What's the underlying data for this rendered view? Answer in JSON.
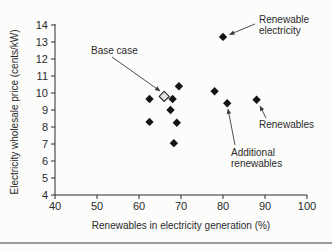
{
  "figure": {
    "background": "#fcfcfb",
    "ink_color": "#2a2a2a",
    "marker_color": "#141414",
    "arrow_color": "#3a3a3a",
    "rule_color": "#9b9b9b"
  },
  "chart_data": {
    "type": "scatter",
    "title": "",
    "xlabel": "Renewables in electricity generation (%)",
    "ylabel": "Electricity wholesale price (cents/kW)",
    "xlim": [
      40,
      100
    ],
    "ylim": [
      4,
      14
    ],
    "xticks": [
      40,
      50,
      60,
      70,
      80,
      90,
      100
    ],
    "yticks": [
      4,
      5,
      6,
      7,
      8,
      9,
      10,
      11,
      12,
      13,
      14
    ],
    "grid": false,
    "legend": "none",
    "series": [
      {
        "name": "Base case",
        "marker": "open-diamond",
        "points": [
          {
            "x": 66,
            "y": 9.8
          }
        ]
      },
      {
        "name": "Scenario results",
        "marker": "filled-diamond",
        "points": [
          {
            "x": 62.5,
            "y": 9.65
          },
          {
            "x": 62.5,
            "y": 8.3
          },
          {
            "x": 67.5,
            "y": 9.0
          },
          {
            "x": 68.0,
            "y": 9.65
          },
          {
            "x": 68.3,
            "y": 7.05
          },
          {
            "x": 69.0,
            "y": 8.25
          },
          {
            "x": 69.5,
            "y": 10.4
          },
          {
            "x": 78.0,
            "y": 10.1
          },
          {
            "x": 80.0,
            "y": 13.3
          },
          {
            "x": 81.0,
            "y": 9.4
          },
          {
            "x": 88.0,
            "y": 9.6
          }
        ]
      }
    ],
    "annotations": [
      {
        "id": "base-case",
        "lines": [
          "Base case"
        ],
        "label_px": {
          "x": 91,
          "y": 47
        },
        "arrow": {
          "x1": 112,
          "y1": 57,
          "x2": 160,
          "y2": 91
        }
      },
      {
        "id": "renewable-electricity",
        "lines": [
          "Renewable",
          "electricity"
        ],
        "label_px": {
          "x": 259,
          "y": 16
        },
        "arrow": {
          "x1": 255,
          "y1": 24,
          "x2": 229.5,
          "y2": 34.5
        }
      },
      {
        "id": "renewables",
        "lines": [
          "Renewables"
        ],
        "label_px": {
          "x": 259,
          "y": 121
        },
        "arrow": {
          "x1": 266,
          "y1": 118,
          "x2": 260,
          "y2": 106
        }
      },
      {
        "id": "additional-renewables",
        "lines": [
          "Additional",
          "renewables"
        ],
        "label_px": {
          "x": 231,
          "y": 149
        },
        "arrow": {
          "x1": 235,
          "y1": 145,
          "x2": 228,
          "y2": 109
        }
      }
    ]
  }
}
